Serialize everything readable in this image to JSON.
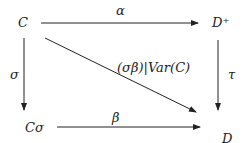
{
  "diagram": {
    "nodes": {
      "C": "C",
      "D_plus": "D⁺",
      "C_sigma": "Cσ",
      "D": "D"
    },
    "arrows": {
      "alpha": "α",
      "sigma": "σ",
      "tau": "τ",
      "beta": "β",
      "diagonal": "(σβ)|Var(C)"
    }
  }
}
